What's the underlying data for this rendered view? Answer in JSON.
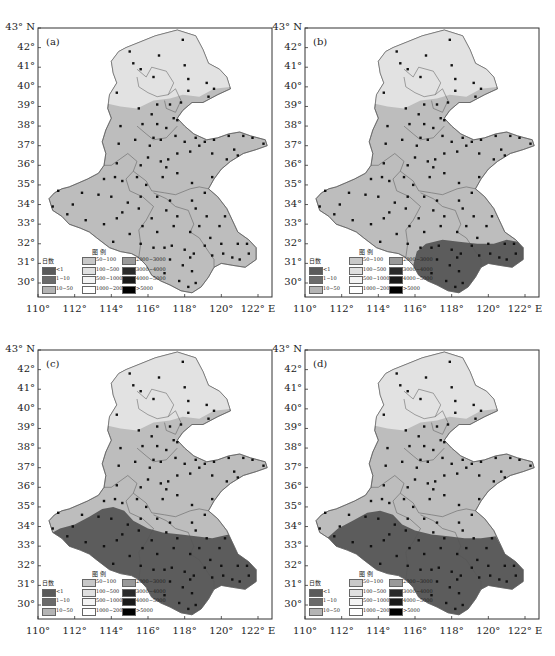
{
  "figure": {
    "caption": ""
  },
  "panels": [
    {
      "id": "a",
      "label": "(a)",
      "dark_region": "none"
    },
    {
      "id": "b",
      "label": "(b)",
      "dark_region": "south-east (Anhui/Jiangsu south)"
    },
    {
      "id": "c",
      "label": "(c)",
      "dark_region": "south (Henan south, Anhui, Jiangsu)"
    },
    {
      "id": "d",
      "label": "(d)",
      "dark_region": "south (Henan south, Anhui, Jiangsu)"
    }
  ],
  "axes": {
    "lat_ticks": [
      "43° N",
      "42°",
      "41°",
      "40°",
      "39°",
      "38°",
      "37°",
      "36°",
      "35°",
      "34°",
      "33°",
      "32°",
      "31°",
      "30°"
    ],
    "lon_ticks": [
      "110°",
      "112°",
      "114°",
      "116°",
      "118°",
      "120°",
      "122° E"
    ]
  },
  "legend": {
    "title": "图  例",
    "col0_header": "日数",
    "items": [
      {
        "label": "<1",
        "color": "#5a5a5a"
      },
      {
        "label": "1~10",
        "color": "#6b6b6b"
      },
      {
        "label": "10~50",
        "color": "#b4b4b4"
      },
      {
        "label": "50~100",
        "color": "#c8c8c8"
      },
      {
        "label": "100~500",
        "color": "#e0e0e0"
      },
      {
        "label": "500~1000",
        "color": "#f4f4f4"
      },
      {
        "label": "1000~2000",
        "color": "#ffffff"
      },
      {
        "label": "2000~3000",
        "color": "#9a9a9a"
      },
      {
        "label": "3000~4000",
        "color": "#2a2a2a"
      },
      {
        "label": "4000~5000",
        "color": "#1a1a1a"
      },
      {
        "label": ">5000",
        "color": "#000000"
      }
    ]
  },
  "map": {
    "region_labels": [
      "北京市",
      "天津市",
      "河北省",
      "山东省",
      "河南省",
      "安徽省",
      "江苏省"
    ],
    "colors": {
      "north_light": "#e2e2e2",
      "middle": "#bdbdbd",
      "dark": "#5c5c5c",
      "border": "#555555",
      "station": "#111111"
    }
  },
  "chart_data": {
    "type": "heatmap",
    "title": "",
    "xlabel": "Longitude",
    "ylabel": "Latitude",
    "xlim": [
      110,
      122.5
    ],
    "ylim": [
      29.5,
      43
    ],
    "panels": [
      "(a)",
      "(b)",
      "(c)",
      "(d)"
    ],
    "legend_categories": [
      "<1",
      "1~10",
      "10~50",
      "50~100",
      "100~500",
      "500~1000",
      "1000~2000",
      "2000~3000",
      "3000~4000",
      "4000~5000",
      ">5000"
    ],
    "legend_header": "日数",
    "legend_title": "图例"
  }
}
